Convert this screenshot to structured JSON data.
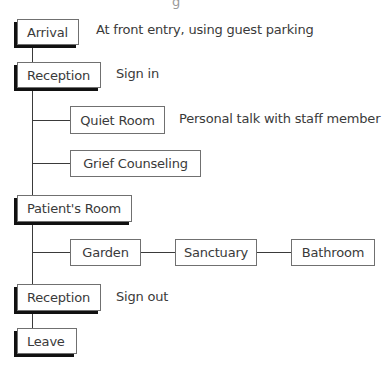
{
  "diagram": {
    "type": "flow",
    "cropped_top_text": "g",
    "nodes": [
      {
        "id": "arrival",
        "label": "Arrival",
        "style": "primary",
        "note": "At front entry, using guest parking"
      },
      {
        "id": "reception_in",
        "label": "Reception",
        "style": "primary",
        "note": "Sign in"
      },
      {
        "id": "quiet_room",
        "label": "Quiet Room",
        "style": "secondary",
        "note": "Personal talk with staff member"
      },
      {
        "id": "grief_counseling",
        "label": "Grief Counseling",
        "style": "secondary"
      },
      {
        "id": "patients_room",
        "label": "Patient's Room",
        "style": "primary"
      },
      {
        "id": "garden",
        "label": "Garden",
        "style": "secondary"
      },
      {
        "id": "sanctuary",
        "label": "Sanctuary",
        "style": "secondary"
      },
      {
        "id": "bathroom",
        "label": "Bathroom",
        "style": "secondary"
      },
      {
        "id": "reception_out",
        "label": "Reception",
        "style": "primary",
        "note": "Sign out"
      },
      {
        "id": "leave",
        "label": "Leave",
        "style": "primary"
      }
    ],
    "edges": [
      [
        "arrival",
        "reception_in"
      ],
      [
        "reception_in",
        "quiet_room"
      ],
      [
        "reception_in",
        "grief_counseling"
      ],
      [
        "reception_in",
        "patients_room"
      ],
      [
        "patients_room",
        "garden"
      ],
      [
        "garden",
        "sanctuary"
      ],
      [
        "sanctuary",
        "bathroom"
      ],
      [
        "patients_room",
        "reception_out"
      ],
      [
        "reception_out",
        "leave"
      ]
    ],
    "colors": {
      "line": "#3a3a3a",
      "border": "#707070",
      "shadow": "#111111",
      "text": "#3a3a3a"
    }
  }
}
